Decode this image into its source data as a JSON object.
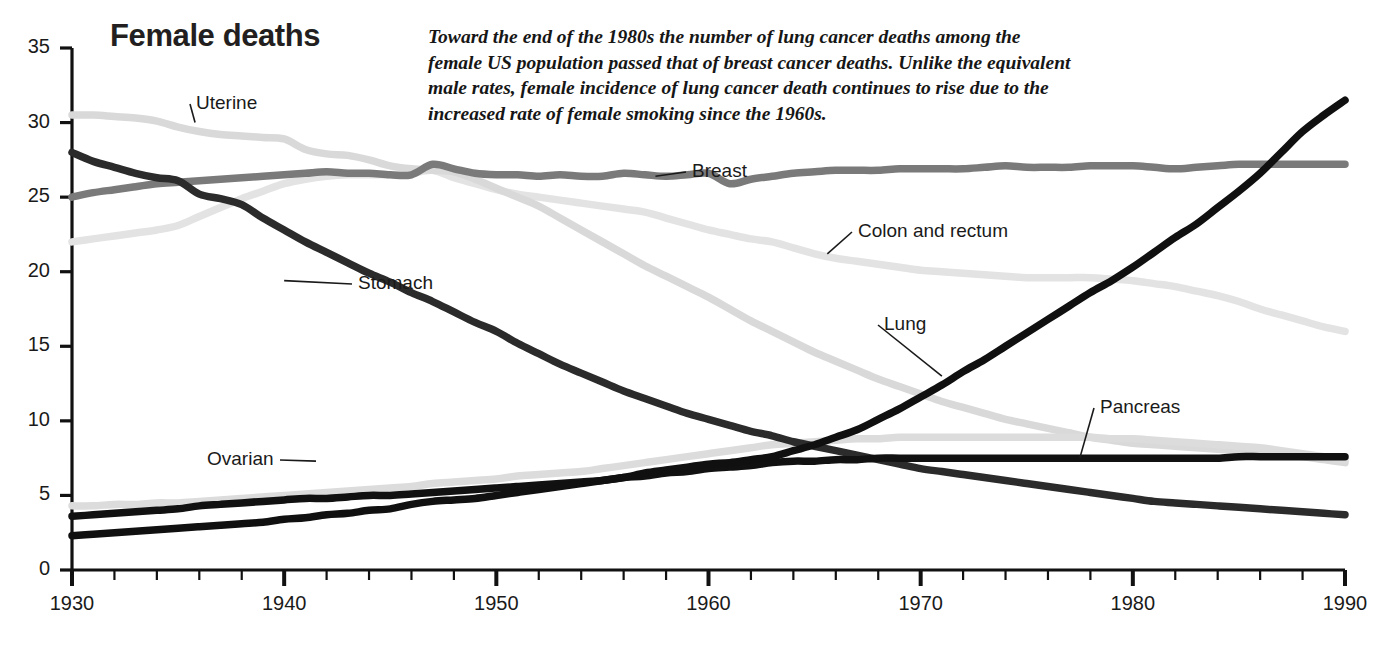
{
  "title": "Female deaths",
  "annotation": {
    "lines": [
      "Toward the end of the 1980s the number of lung cancer deaths among the",
      "female US population passed that of breast cancer deaths. Unlike the equivalent",
      "male rates, female incidence of lung cancer death continues to rise due to the",
      "increased rate of female smoking since the 1960s."
    ]
  },
  "axes": {
    "y_ticks": [
      "0",
      "5",
      "10",
      "15",
      "20",
      "25",
      "30",
      "35"
    ],
    "x_ticks": [
      "1930",
      "1940",
      "1950",
      "1960",
      "1970",
      "1980",
      "1990"
    ]
  },
  "series_labels": {
    "uterine": "Uterine",
    "breast": "Breast",
    "colon": "Colon and rectum",
    "stomach": "Stomach",
    "lung": "Lung",
    "ovarian": "Ovarian",
    "pancreas": "Pancreas"
  },
  "chart_data": {
    "type": "line",
    "title": "Female deaths",
    "subtitle": "Toward the end of the 1980s the number of lung cancer deaths among the female US population passed that of breast cancer deaths. Unlike the equivalent male rates, female incidence of lung cancer death continues to rise due to the increased rate of female smoking since the 1960s.",
    "xlabel": "",
    "ylabel": "",
    "xlim": [
      1930,
      1990
    ],
    "ylim": [
      0,
      35
    ],
    "grid": false,
    "legend": "inline-labels",
    "x_major_step": 10,
    "x_minor_step": 2,
    "y_major_step": 5,
    "x": [
      1930,
      1931,
      1932,
      1933,
      1934,
      1935,
      1936,
      1937,
      1938,
      1939,
      1940,
      1941,
      1942,
      1943,
      1944,
      1945,
      1946,
      1947,
      1948,
      1949,
      1950,
      1951,
      1952,
      1953,
      1954,
      1955,
      1956,
      1957,
      1958,
      1959,
      1960,
      1961,
      1962,
      1963,
      1964,
      1965,
      1966,
      1967,
      1968,
      1969,
      1970,
      1971,
      1972,
      1973,
      1974,
      1975,
      1976,
      1977,
      1978,
      1979,
      1980,
      1981,
      1982,
      1983,
      1984,
      1985,
      1986,
      1987,
      1988,
      1989,
      1990
    ],
    "series": [
      {
        "name": "Uterine",
        "color": "#d9d9d9",
        "values": [
          30.5,
          30.5,
          30.4,
          30.3,
          30.1,
          29.7,
          29.4,
          29.2,
          29.1,
          29.0,
          28.9,
          28.2,
          27.9,
          27.8,
          27.5,
          27.1,
          26.9,
          26.8,
          26.7,
          26.2,
          25.6,
          25.0,
          24.4,
          23.6,
          22.8,
          22.0,
          21.2,
          20.4,
          19.7,
          19.0,
          18.3,
          17.5,
          16.7,
          16.0,
          15.3,
          14.6,
          14.0,
          13.4,
          12.8,
          12.3,
          11.8,
          11.3,
          10.9,
          10.5,
          10.1,
          9.8,
          9.5,
          9.2,
          8.9,
          8.7,
          8.5,
          8.4,
          8.3,
          8.2,
          8.1,
          8.0,
          7.9,
          7.8,
          7.6,
          7.4,
          7.2
        ]
      },
      {
        "name": "Stomach",
        "color": "#2b2b2b",
        "values": [
          28.0,
          27.4,
          27.0,
          26.6,
          26.3,
          26.1,
          25.2,
          24.9,
          24.5,
          23.6,
          22.8,
          22.0,
          21.3,
          20.6,
          19.9,
          19.3,
          18.6,
          18.0,
          17.3,
          16.6,
          16.0,
          15.2,
          14.5,
          13.8,
          13.2,
          12.6,
          12.0,
          11.5,
          11.0,
          10.5,
          10.1,
          9.7,
          9.3,
          9.0,
          8.6,
          8.3,
          8.0,
          7.7,
          7.4,
          7.1,
          6.8,
          6.6,
          6.4,
          6.2,
          6.0,
          5.8,
          5.6,
          5.4,
          5.2,
          5.0,
          4.8,
          4.6,
          4.5,
          4.4,
          4.3,
          4.2,
          4.1,
          4.0,
          3.9,
          3.8,
          3.7
        ]
      },
      {
        "name": "Breast",
        "color": "#7a7a7a",
        "values": [
          25.0,
          25.3,
          25.5,
          25.7,
          25.9,
          26.0,
          26.1,
          26.2,
          26.3,
          26.4,
          26.5,
          26.6,
          26.7,
          26.6,
          26.6,
          26.5,
          26.5,
          27.2,
          26.9,
          26.6,
          26.5,
          26.5,
          26.4,
          26.5,
          26.4,
          26.4,
          26.6,
          26.5,
          26.4,
          26.5,
          26.6,
          25.9,
          26.2,
          26.4,
          26.6,
          26.7,
          26.8,
          26.8,
          26.8,
          26.9,
          26.9,
          26.9,
          26.9,
          27.0,
          27.1,
          27.0,
          27.0,
          27.0,
          27.1,
          27.1,
          27.1,
          27.0,
          26.9,
          27.0,
          27.1,
          27.2,
          27.2,
          27.2,
          27.2,
          27.2,
          27.2
        ]
      },
      {
        "name": "Colon and rectum",
        "color": "#e3e3e3",
        "values": [
          22.0,
          22.2,
          22.4,
          22.6,
          22.8,
          23.1,
          23.7,
          24.3,
          24.9,
          25.4,
          25.9,
          26.2,
          26.4,
          26.5,
          26.5,
          26.5,
          26.6,
          26.8,
          26.3,
          25.9,
          25.5,
          25.2,
          25.0,
          24.8,
          24.6,
          24.4,
          24.2,
          24.0,
          23.6,
          23.2,
          22.8,
          22.5,
          22.2,
          22.0,
          21.6,
          21.2,
          20.9,
          20.7,
          20.5,
          20.3,
          20.1,
          20.0,
          19.9,
          19.8,
          19.7,
          19.6,
          19.6,
          19.6,
          19.6,
          19.5,
          19.4,
          19.2,
          19.0,
          18.7,
          18.4,
          18.0,
          17.5,
          17.1,
          16.7,
          16.3,
          16.0
        ]
      },
      {
        "name": "Lung",
        "color": "#101010",
        "values": [
          2.3,
          2.4,
          2.5,
          2.6,
          2.7,
          2.8,
          2.9,
          3.0,
          3.1,
          3.2,
          3.4,
          3.5,
          3.7,
          3.8,
          4.0,
          4.1,
          4.4,
          4.6,
          4.7,
          4.8,
          5.0,
          5.2,
          5.4,
          5.6,
          5.8,
          6.0,
          6.2,
          6.5,
          6.7,
          6.9,
          7.1,
          7.2,
          7.4,
          7.6,
          8.0,
          8.4,
          8.9,
          9.4,
          10.1,
          10.8,
          11.6,
          12.4,
          13.3,
          14.1,
          15.0,
          15.9,
          16.8,
          17.7,
          18.6,
          19.4,
          20.3,
          21.3,
          22.3,
          23.2,
          24.3,
          25.4,
          26.6,
          28.0,
          29.4,
          30.5,
          31.5
        ]
      },
      {
        "name": "Ovarian",
        "color": "#dcdcdc",
        "values": [
          4.3,
          4.3,
          4.4,
          4.4,
          4.5,
          4.5,
          4.6,
          4.7,
          4.8,
          4.9,
          5.0,
          5.1,
          5.2,
          5.3,
          5.4,
          5.5,
          5.6,
          5.8,
          5.9,
          6.0,
          6.1,
          6.3,
          6.4,
          6.5,
          6.6,
          6.8,
          7.0,
          7.2,
          7.4,
          7.6,
          7.8,
          8.0,
          8.2,
          8.4,
          8.5,
          8.6,
          8.7,
          8.8,
          8.8,
          8.9,
          8.9,
          8.9,
          8.9,
          8.9,
          8.9,
          8.9,
          8.9,
          8.9,
          8.9,
          8.8,
          8.8,
          8.7,
          8.6,
          8.5,
          8.4,
          8.3,
          8.2,
          8.0,
          7.8,
          7.6,
          7.4
        ]
      },
      {
        "name": "Pancreas",
        "color": "#111111",
        "values": [
          3.6,
          3.7,
          3.8,
          3.9,
          4.0,
          4.1,
          4.3,
          4.4,
          4.5,
          4.6,
          4.7,
          4.8,
          4.8,
          4.9,
          5.0,
          5.0,
          5.1,
          5.2,
          5.3,
          5.4,
          5.5,
          5.6,
          5.7,
          5.8,
          5.9,
          6.0,
          6.2,
          6.3,
          6.5,
          6.6,
          6.8,
          6.9,
          7.0,
          7.2,
          7.3,
          7.3,
          7.4,
          7.4,
          7.5,
          7.5,
          7.5,
          7.5,
          7.5,
          7.5,
          7.5,
          7.5,
          7.5,
          7.5,
          7.5,
          7.5,
          7.5,
          7.5,
          7.5,
          7.5,
          7.5,
          7.6,
          7.6,
          7.6,
          7.6,
          7.6,
          7.6
        ]
      }
    ],
    "leader_lines": [
      {
        "label": "Uterine",
        "x": 1935.8,
        "y": 30.0
      },
      {
        "label": "Breast",
        "x": 1957.5,
        "y": 26.4
      },
      {
        "label": "Colon and rectum",
        "x": 1965.6,
        "y": 21.2
      },
      {
        "label": "Stomach",
        "x": 1940.0,
        "y": 19.4
      },
      {
        "label": "Lung",
        "x": 1971.0,
        "y": 13.0
      },
      {
        "label": "Ovarian",
        "x": 1941.5,
        "y": 7.3
      },
      {
        "label": "Pancreas",
        "x": 1977.5,
        "y": 7.5
      }
    ]
  }
}
